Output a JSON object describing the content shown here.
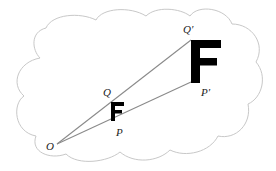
{
  "diagram": {
    "type": "dilation",
    "colors": {
      "cloud_stroke": "#c8c8c8",
      "ray_stroke": "#8a8a8a",
      "figure_fill": "#000000",
      "label": "#222222"
    },
    "center": {
      "label": "O",
      "x": 57,
      "y": 144
    },
    "points": [
      {
        "id": "Q",
        "label": "Q",
        "x": 112,
        "y": 100,
        "label_x": 103,
        "label_y": 96
      },
      {
        "id": "P",
        "label": "P",
        "x": 112,
        "y": 122,
        "label_x": 116,
        "label_y": 136
      },
      {
        "id": "Q_prime",
        "label": "Q′",
        "x": 191,
        "y": 40,
        "label_x": 183,
        "label_y": 33
      },
      {
        "id": "P_prime",
        "label": "P′",
        "x": 191,
        "y": 82,
        "label_x": 201,
        "label_y": 96
      }
    ],
    "center_label": {
      "label": "O",
      "x": 46,
      "y": 150
    },
    "figures": [
      {
        "name": "original-F",
        "glyph": "F",
        "size": "small"
      },
      {
        "name": "image-F",
        "glyph": "F",
        "size": "large"
      }
    ]
  }
}
